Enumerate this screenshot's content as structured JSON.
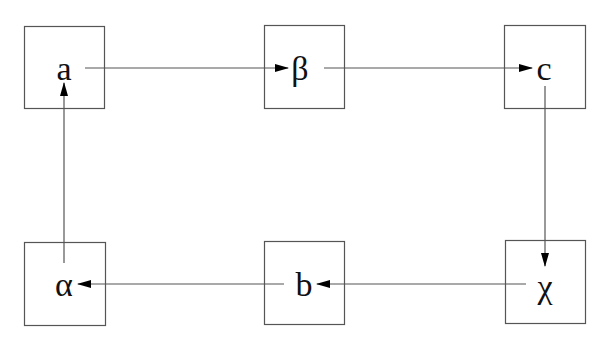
{
  "diagram": {
    "type": "flow-cycle",
    "stroke_color": "#555555",
    "arrow_color": "#000000",
    "nodes": [
      {
        "id": "a",
        "label": "a",
        "x": 24,
        "y": 26,
        "w": 80,
        "h": 82,
        "lx": 64,
        "ly": 80
      },
      {
        "id": "beta",
        "label": "β",
        "x": 264,
        "y": 25,
        "w": 80,
        "h": 83,
        "lx": 300,
        "ly": 80
      },
      {
        "id": "c",
        "label": "c",
        "x": 504,
        "y": 25,
        "w": 81,
        "h": 83,
        "lx": 544,
        "ly": 80
      },
      {
        "id": "alpha",
        "label": "α",
        "x": 24,
        "y": 242,
        "w": 81,
        "h": 83,
        "lx": 64,
        "ly": 296
      },
      {
        "id": "b",
        "label": "b",
        "x": 264,
        "y": 241,
        "w": 80,
        "h": 83,
        "lx": 304,
        "ly": 296
      },
      {
        "id": "chi",
        "label": "χ",
        "x": 505,
        "y": 240,
        "w": 80,
        "h": 83,
        "lx": 545,
        "ly": 298
      }
    ],
    "edges": [
      {
        "from": "a",
        "to": "beta",
        "x1": 85,
        "y1": 68,
        "x2": 288,
        "y2": 68
      },
      {
        "from": "beta",
        "to": "c",
        "x1": 324,
        "y1": 68,
        "x2": 532,
        "y2": 68
      },
      {
        "from": "c",
        "to": "chi",
        "x1": 545,
        "y1": 86,
        "x2": 545,
        "y2": 266
      },
      {
        "from": "chi",
        "to": "b",
        "x1": 526,
        "y1": 284,
        "x2": 317,
        "y2": 284
      },
      {
        "from": "b",
        "to": "alpha",
        "x1": 284,
        "y1": 284,
        "x2": 78,
        "y2": 284
      },
      {
        "from": "alpha",
        "to": "a",
        "x1": 64,
        "y1": 263,
        "x2": 64,
        "y2": 83
      }
    ]
  }
}
